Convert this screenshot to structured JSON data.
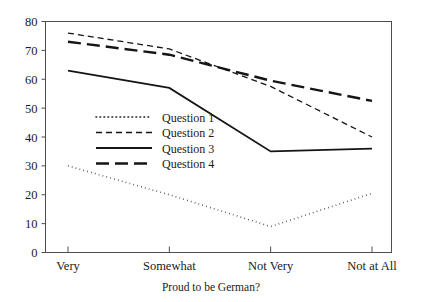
{
  "chart_data": {
    "type": "line",
    "title": "",
    "subtitle": "",
    "xlabel": "Proud to be German?",
    "ylabel": "",
    "categories": [
      "Very",
      "Somewhat",
      "Not Very",
      "Not at All"
    ],
    "ylim": [
      0,
      80
    ],
    "yticks": [
      0,
      10,
      20,
      30,
      40,
      50,
      60,
      70,
      80
    ],
    "grid": false,
    "legend_position": "center-left-inside",
    "series": [
      {
        "name": "Question 1",
        "style": "dotted",
        "values": [
          30,
          20,
          9,
          20.5
        ]
      },
      {
        "name": "Question 2",
        "style": "short-dashed",
        "values": [
          76,
          70.5,
          57.5,
          40
        ]
      },
      {
        "name": "Question 3",
        "style": "solid",
        "values": [
          63,
          57,
          35,
          36
        ]
      },
      {
        "name": "Question 4",
        "style": "long-dashed",
        "values": [
          73,
          68.5,
          59.5,
          52.5
        ]
      }
    ],
    "colors": {
      "line": "#151515",
      "axis": "#4d4d4d",
      "text": "#1a1a1a",
      "background": "#ffffff"
    }
  },
  "axis": {
    "y_tick_labels": [
      "0",
      "10",
      "20",
      "30",
      "40",
      "50",
      "60",
      "70",
      "80"
    ],
    "x_tick_labels": [
      "Very",
      "Somewhat",
      "Not Very",
      "Not at All"
    ],
    "x_axis_title": "Proud to be German?"
  },
  "legend": {
    "entries": [
      {
        "label": "Question 1"
      },
      {
        "label": "Question 2"
      },
      {
        "label": "Question 3"
      },
      {
        "label": "Question 4"
      }
    ]
  }
}
